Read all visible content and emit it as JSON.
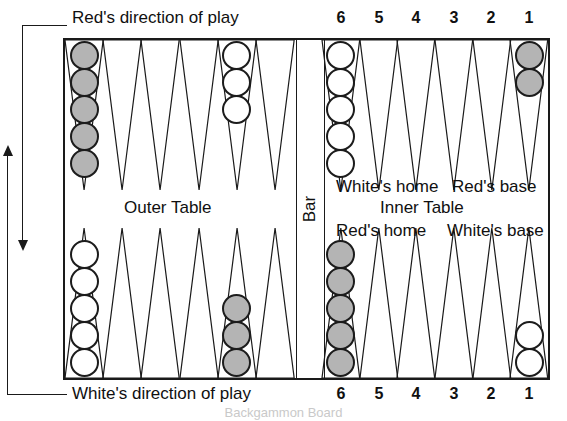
{
  "figure": {
    "caption": "Backgammon Board"
  },
  "labels": {
    "red_direction": "Red's direction of play",
    "white_direction": "White's direction of play",
    "bar": "Bar",
    "outer_table": "Outer Table",
    "inner_table": "Inner Table",
    "whites_home": "White's home",
    "reds_base": "Red's base",
    "reds_home": "Red's home",
    "whites_base": "White's base"
  },
  "point_numbers": {
    "top": [
      "6",
      "5",
      "4",
      "3",
      "2",
      "1"
    ],
    "bottom": [
      "6",
      "5",
      "4",
      "3",
      "2",
      "1"
    ]
  },
  "colors": {
    "white_checker": "#ffffff",
    "gray_checker": "#b4b4b4",
    "ink": "#1a1a1a",
    "board_background": "#ffffff"
  },
  "chart_data": {
    "type": "diagram",
    "title": "Backgammon Board",
    "quadrants": [
      {
        "name": "top-left-outer-table",
        "stacks": [
          {
            "point_index": 0,
            "color": "gray",
            "count": 5
          },
          {
            "point_index": 4,
            "color": "white",
            "count": 3
          }
        ]
      },
      {
        "name": "top-right-inner-table",
        "stacks": [
          {
            "point_index": 0,
            "color": "white",
            "count": 5
          },
          {
            "point_index": 5,
            "color": "gray",
            "count": 2
          }
        ]
      },
      {
        "name": "bottom-left-outer-table",
        "stacks": [
          {
            "point_index": 0,
            "color": "white",
            "count": 5
          },
          {
            "point_index": 4,
            "color": "gray",
            "count": 3
          }
        ]
      },
      {
        "name": "bottom-right-inner-table",
        "stacks": [
          {
            "point_index": 0,
            "color": "gray",
            "count": 5
          },
          {
            "point_index": 5,
            "color": "white",
            "count": 2
          }
        ]
      }
    ]
  }
}
